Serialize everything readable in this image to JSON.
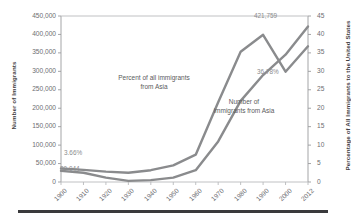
{
  "chart_data": {
    "type": "line",
    "title": "",
    "subtitle": "",
    "xlabel": "",
    "ylabel": "Number of Immigrants",
    "y2label": "Percentage of All Immigrants to the United States",
    "x": [
      "1900",
      "1910",
      "1920",
      "1930",
      "1940",
      "1950",
      "1960",
      "1970",
      "1980",
      "1990",
      "2000",
      "2012"
    ],
    "categories": [
      "1900",
      "1910",
      "1920",
      "1930",
      "1940",
      "1950",
      "1960",
      "1970",
      "1980",
      "1990",
      "2000",
      "2012"
    ],
    "ylim": [
      0,
      450000
    ],
    "yticks": [
      0,
      50000,
      100000,
      150000,
      200000,
      250000,
      300000,
      350000,
      400000,
      450000
    ],
    "ytick_labels": [
      "0",
      "50,000",
      "100,000",
      "150,000",
      "200,000",
      "250,000",
      "300,000",
      "350,000",
      "400,000",
      "450,000"
    ],
    "y2lim": [
      0,
      45
    ],
    "y2ticks": [
      0,
      5,
      10,
      15,
      20,
      25,
      30,
      35,
      40,
      45
    ],
    "y2tick_labels": [
      "0",
      "5",
      "10",
      "15",
      "20",
      "25",
      "30",
      "35",
      "40",
      "45"
    ],
    "grid": false,
    "legend_position": "inline-annotations",
    "line_color": "#8a8b8d",
    "series": [
      {
        "name": "Percent of all immigrants from Asia",
        "axis": "right",
        "unit": "%",
        "values": [
          3.66,
          3.3,
          2.8,
          2.5,
          3.2,
          4.5,
          7.4,
          21.6,
          35.3,
          39.9,
          29.9,
          36.78
        ]
      },
      {
        "name": "Number of immigrants from Asia",
        "axis": "left",
        "unit": "people",
        "values": [
          30044,
          25000,
          12000,
          3000,
          5000,
          12000,
          32000,
          110000,
          220000,
          290000,
          345000,
          421759
        ]
      }
    ],
    "annotations": [
      {
        "name": "percent-series-annotation",
        "line1": "Percent of all immigrants",
        "line2": "from Asia"
      },
      {
        "name": "number-series-annotation",
        "line1": "Number of",
        "line2": "immigrants from Asia"
      }
    ],
    "data_labels": {
      "start_percent": "3.66%",
      "start_number": "30,044",
      "end_number": "421,759",
      "end_percent": "36.78%"
    }
  }
}
